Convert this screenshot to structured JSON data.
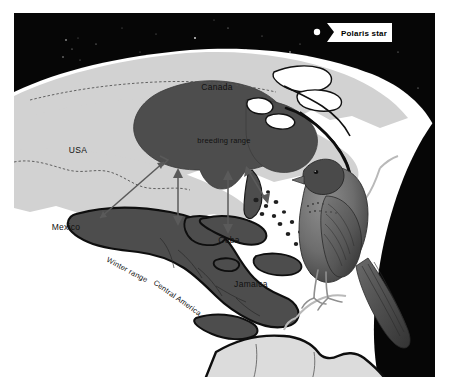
{
  "figure": {
    "width": 449,
    "height": 392
  },
  "colors": {
    "space": "#060606",
    "star": "#ffffff",
    "land_light": "#d2d2d2",
    "land_mid": "#c9c9c9",
    "range_dark": "#4d4d4d",
    "ocean": "#ffffff",
    "coast_outline": "#111111",
    "border_line": "#555555",
    "arrow": "#5a5a5a",
    "label_text": "#111111",
    "callout_bg": "#ffffff"
  },
  "callout": {
    "label": "Polaris star",
    "star_icon": "star-dot-icon"
  },
  "labels": {
    "canada": "Canada",
    "usa": "USA",
    "mexico": "Mexico",
    "cuba": "Cuba",
    "jamaica": "Jamaica",
    "breeding_range": "breeding range",
    "winter_range": "Winter range",
    "central_america": "Central America"
  },
  "legend_regions": [
    {
      "name": "breeding range",
      "shade": "#4d4d4d"
    },
    {
      "name": "Winter range",
      "shade": "#4d4d4d"
    }
  ],
  "arrows": [
    {
      "name": "mexico-to-breeding-arrow",
      "heads": "double"
    },
    {
      "name": "gulf-crossing-arrow",
      "heads": "double"
    },
    {
      "name": "florida-caribbean-arrow",
      "heads": "double"
    },
    {
      "name": "atlantic-route-arrow",
      "heads": "double"
    }
  ],
  "illustration": {
    "bird": "purple-martin-bird-illustration",
    "perch": "branch-perch"
  }
}
